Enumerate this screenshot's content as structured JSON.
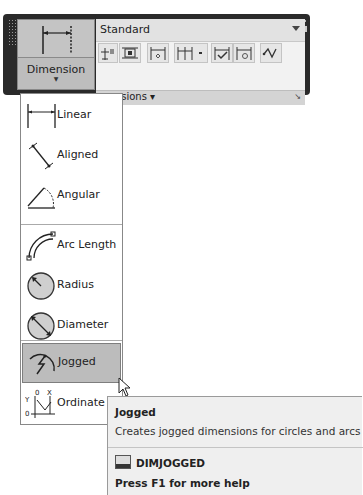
{
  "panel": {
    "big_button": {
      "label": "Dimension",
      "icon": "linear-dimension-icon"
    },
    "style_dropdown": {
      "value": "Standard"
    },
    "toolbar_icons": [
      "quick-dimension-icon",
      "continue-dimension-icon",
      "dimension-space-icon",
      "baseline-dimension-icon",
      "inspect-dimension-icon",
      "update-dimension-icon",
      "dimension-jog-line-icon"
    ],
    "title": "Dimensions",
    "title_visible": "mensions"
  },
  "menu": {
    "items": [
      {
        "label": "Linear",
        "icon": "linear-icon"
      },
      {
        "label": "Aligned",
        "icon": "aligned-icon"
      },
      {
        "label": "Angular",
        "icon": "angular-icon"
      },
      {
        "label": "Arc Length",
        "icon": "arc-length-icon"
      },
      {
        "label": "Radius",
        "icon": "radius-icon"
      },
      {
        "label": "Diameter",
        "icon": "diameter-icon"
      },
      {
        "label": "Jogged",
        "icon": "jogged-icon",
        "highlighted": true
      },
      {
        "label": "Ordinate",
        "icon": "ordinate-icon"
      }
    ]
  },
  "tooltip": {
    "title": "Jogged",
    "description": "Creates jogged dimensions for circles and arcs",
    "command": "DIMJOGGED",
    "help": "Press F1 for more help"
  },
  "colors": {
    "panel_dark": "#2a2a2a",
    "button_gray": "#bdbdbd",
    "highlight": "#bcbcbc",
    "tooltip_bg": "#efefef"
  }
}
